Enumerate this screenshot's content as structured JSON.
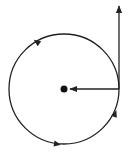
{
  "diagram": {
    "type": "circular-motion",
    "colors": {
      "stroke": "#222222",
      "background": "#ffffff"
    },
    "circle": {
      "cx": 64,
      "cy": 89,
      "r": 55,
      "direction": "counterclockwise"
    },
    "center_point": {
      "cx": 64,
      "cy": 89,
      "r": 3.5
    },
    "radial_arrow": {
      "x1": 119,
      "y1": 89,
      "x2": 70,
      "y2": 89,
      "meaning": "centripetal"
    },
    "tangent_arrow": {
      "x1": 119,
      "y1": 89,
      "x2": 119,
      "y2": 6,
      "meaning": "velocity"
    },
    "direction_markers": [
      {
        "x": 37,
        "y": 42,
        "angle": 215
      },
      {
        "x": 57,
        "y": 144,
        "angle": 10
      },
      {
        "x": 115,
        "y": 114,
        "angle": 290
      }
    ]
  }
}
